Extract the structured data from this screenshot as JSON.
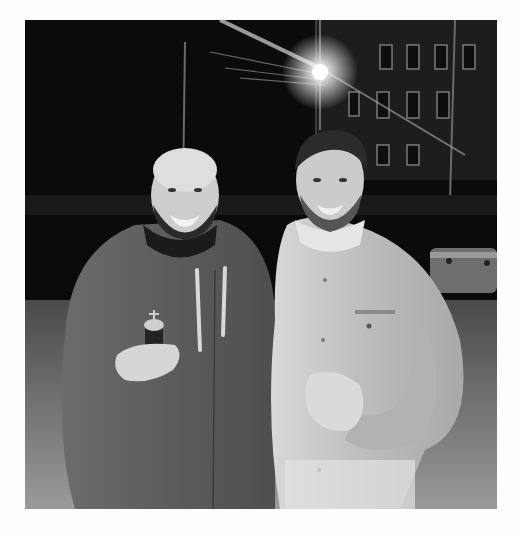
{
  "photo": {
    "description": "Black and white night photo of two smiling men standing side by side in front of a building with a bright street light",
    "tone": "grayscale",
    "colors": {
      "background_page": "#fdfdfd",
      "night_sky": "#0b0b0b",
      "building": "#2a2a2a",
      "hoodie": "#5a5a5a",
      "shirt": "#bdbdbd",
      "skin": "#cfcfcf",
      "ground": "#8a8a8a",
      "light": "#ffffff"
    },
    "subjects": [
      {
        "position": "left",
        "description": "bald bearded man in dark zip hoodie with light drawstrings, holding a bottle"
      },
      {
        "position": "right",
        "description": "man with dark hair and beard in light button-up shirt, hand on chest"
      }
    ],
    "background_elements": [
      "street light with flare",
      "multi-story building with windows",
      "power lines",
      "parked vehicle at right"
    ]
  }
}
